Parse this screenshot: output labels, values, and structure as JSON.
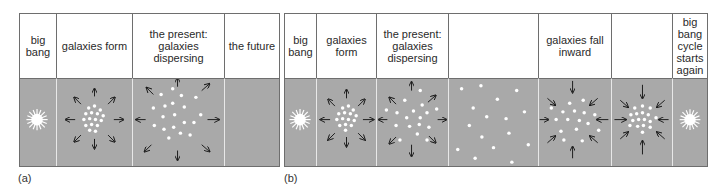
{
  "figure": {
    "panel_a": {
      "label": "(a)",
      "columns": [
        {
          "header": "big bang",
          "scene": "burst"
        },
        {
          "header": "galaxies form",
          "scene": "expand-dense"
        },
        {
          "header": "the present: galaxies dispersing",
          "scene": "expand-sparse"
        },
        {
          "header": "the future",
          "scene": "empty"
        }
      ]
    },
    "panel_b": {
      "label": "(b)",
      "columns": [
        {
          "header": "big bang",
          "scene": "burst"
        },
        {
          "header": "galaxies form",
          "scene": "expand-dense"
        },
        {
          "header": "the present: galaxies dispersing",
          "scene": "expand-sparse"
        },
        {
          "header": "",
          "scene": "scattered"
        },
        {
          "header": "galaxies fall inward",
          "scene": "contract-sparse"
        },
        {
          "header": "",
          "scene": "contract-dense"
        },
        {
          "header": "big bang cycle starts again",
          "scene": "burst"
        }
      ]
    },
    "colors": {
      "background": "#a9a9a9",
      "galaxy": "#ffffff",
      "arrow": "#1a1a1a",
      "border": "#6e6e6e"
    }
  }
}
